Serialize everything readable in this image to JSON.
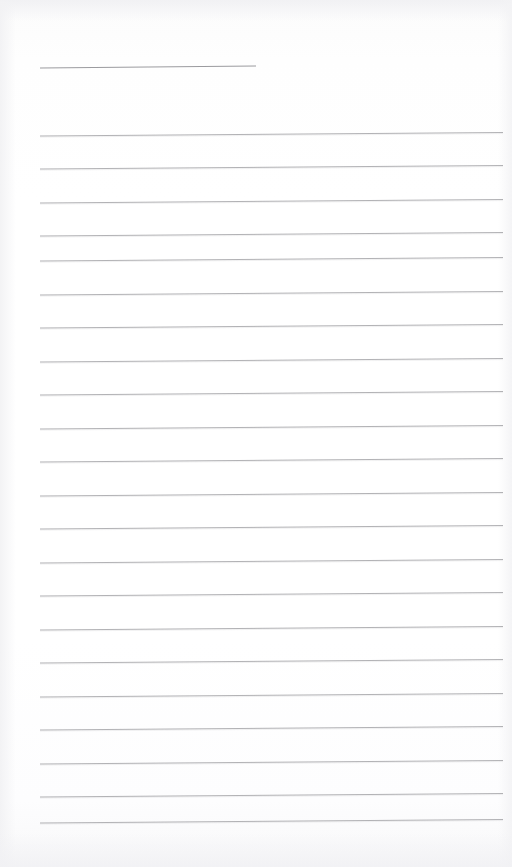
{
  "document": {
    "kind": "scanned-lined-paper",
    "paper_color": "#fdfdfd",
    "rule_color": "#a9a9ad",
    "rule_color_light": "#c2c2c6",
    "width": 512,
    "height": 867,
    "skew_degrees": -0.45,
    "text_content": "",
    "alt_text": "Blank ruled notepad page with a short title rule and twenty-one full-width horizontal lines"
  },
  "title_rule": {
    "name": "title-rule",
    "x1": 40,
    "x2": 256,
    "y": 68,
    "y_right": 66,
    "thickness": 1.1,
    "color": "#9b9b9f",
    "value": ""
  },
  "rules": {
    "count": 21,
    "left": 40,
    "right": 503,
    "first_y": 136,
    "spacing": 33.5,
    "thickness": 0.9,
    "color": "#a9a9ad",
    "rise": 3.5,
    "lines": [
      {
        "index": 1,
        "y": 136,
        "value": ""
      },
      {
        "index": 2,
        "y": 169,
        "value": ""
      },
      {
        "index": 3,
        "y": 203,
        "value": ""
      },
      {
        "index": 4,
        "y": 236,
        "value": ""
      },
      {
        "index": 5,
        "y": 261,
        "value": ""
      },
      {
        "index": 6,
        "y": 295,
        "value": ""
      },
      {
        "index": 7,
        "y": 328,
        "value": ""
      },
      {
        "index": 8,
        "y": 362,
        "value": ""
      },
      {
        "index": 9,
        "y": 395,
        "value": ""
      },
      {
        "index": 10,
        "y": 429,
        "value": ""
      },
      {
        "index": 11,
        "y": 462,
        "value": ""
      },
      {
        "index": 12,
        "y": 496,
        "value": ""
      },
      {
        "index": 13,
        "y": 529,
        "value": ""
      },
      {
        "index": 14,
        "y": 563,
        "value": ""
      },
      {
        "index": 15,
        "y": 596,
        "value": ""
      },
      {
        "index": 16,
        "y": 630,
        "value": ""
      },
      {
        "index": 17,
        "y": 663,
        "value": ""
      },
      {
        "index": 18,
        "y": 697,
        "value": ""
      },
      {
        "index": 19,
        "y": 730,
        "value": ""
      },
      {
        "index": 20,
        "y": 764,
        "value": ""
      },
      {
        "index": 21,
        "y": 797,
        "value": ""
      },
      {
        "index": 22,
        "y": 823,
        "value": ""
      }
    ]
  }
}
